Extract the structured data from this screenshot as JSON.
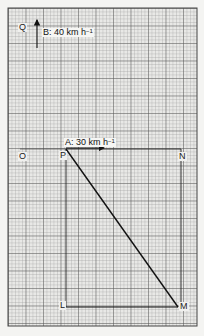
{
  "diagram": {
    "type": "relative-velocity-graph-paper",
    "points": {
      "Q": {
        "label": "Q"
      },
      "O": {
        "label": "O"
      },
      "P": {
        "label": "P"
      },
      "N": {
        "label": "N"
      },
      "L": {
        "label": "L"
      },
      "M": {
        "label": "M"
      }
    },
    "vectors": {
      "B": {
        "name": "B",
        "speed": "40 km h",
        "unit_exp": "−1",
        "text": "B: 40 km h"
      },
      "A": {
        "name": "A",
        "speed": "30 km h",
        "unit_exp": "−1",
        "text": "A: 30 km h"
      }
    },
    "colors": {
      "paper": "#f4f4f2",
      "grid_fine": "#9a9a9a",
      "grid_major": "#4a4a4a",
      "ink": "#1a1a1a"
    }
  }
}
